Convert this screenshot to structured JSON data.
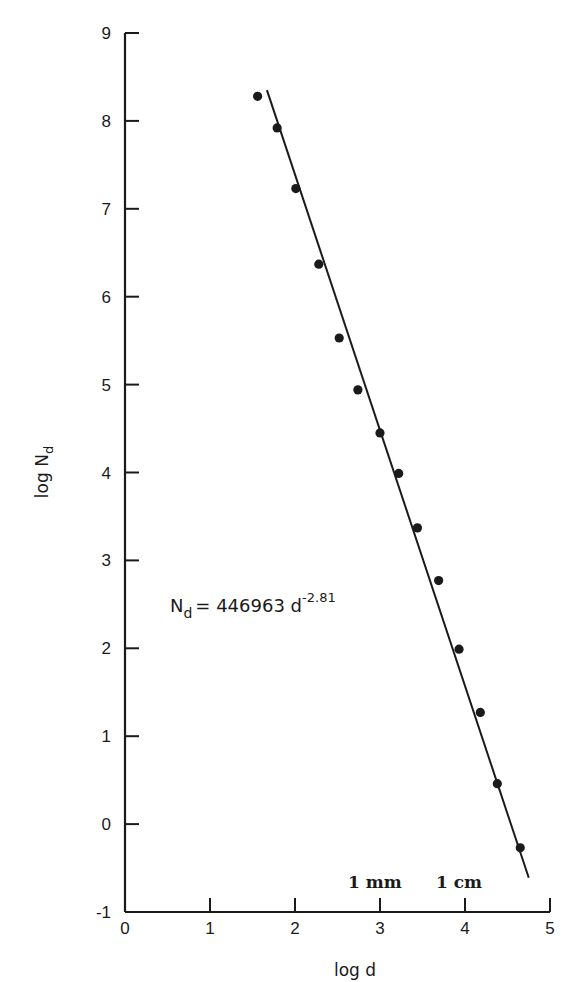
{
  "chart_data": {
    "type": "scatter",
    "title": "",
    "xlabel": "log d",
    "ylabel": "log N_d",
    "xlim": [
      0,
      5
    ],
    "ylim": [
      -1,
      9
    ],
    "x_ticks": [
      "0",
      "1",
      "2",
      "3",
      "4",
      "5"
    ],
    "y_ticks": [
      "-1",
      "0",
      "1",
      "2",
      "3",
      "4",
      "5",
      "6",
      "7",
      "8",
      "9"
    ],
    "grid": false,
    "legend": null,
    "series": [
      {
        "name": "observed",
        "type": "scatter",
        "x": [
          1.56,
          1.79,
          2.01,
          2.28,
          2.52,
          2.74,
          3.0,
          3.22,
          3.44,
          3.69,
          3.93,
          4.18,
          4.38,
          4.65
        ],
        "y": [
          8.28,
          7.92,
          7.23,
          6.37,
          5.53,
          4.94,
          4.45,
          3.99,
          3.37,
          2.77,
          1.99,
          1.27,
          0.46,
          -0.27
        ]
      },
      {
        "name": "power-law fit",
        "type": "line",
        "x": [
          1.67,
          4.75
        ],
        "y": [
          8.35,
          -0.61
        ]
      }
    ],
    "annotations": [
      {
        "text": "N_d = 446963 d^-2.81",
        "x": 0.55,
        "y": 2.65
      },
      {
        "text": "1 mm",
        "x": 2.75,
        "y": -0.65
      },
      {
        "text": "1 cm",
        "x": 3.85,
        "y": -0.65
      }
    ]
  },
  "labels": {
    "xlabel": "log d",
    "ylabel_main": "log N",
    "ylabel_sub": "d",
    "equation_lhs": "N",
    "equation_lhs_sub": "d",
    "equation_rhs": "= 446963 d",
    "equation_exp": "-2.81",
    "annot_mm": "1 mm",
    "annot_cm": "1 cm"
  },
  "colors": {
    "ink": "#1a1a1a",
    "background": "#ffffff"
  }
}
